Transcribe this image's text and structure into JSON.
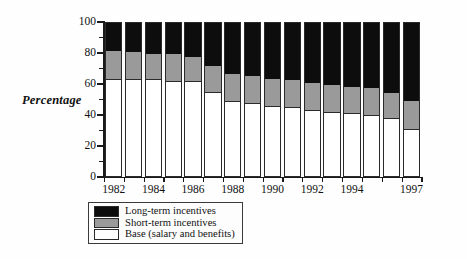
{
  "chart_data": {
    "type": "bar",
    "subtype": "stacked-100-percent",
    "title": "",
    "xlabel": "",
    "ylabel": "Percentage",
    "ylim": [
      0,
      100
    ],
    "yticks": [
      0,
      20,
      40,
      60,
      80,
      100
    ],
    "ytick_labels": [
      "0",
      "20",
      "40",
      "60",
      "80",
      "100"
    ],
    "grid": false,
    "legend_position": "below-left",
    "categories": [
      "1982",
      "1983",
      "1984",
      "1985",
      "1986",
      "1987",
      "1988",
      "1989",
      "1990",
      "1991",
      "1992",
      "1993",
      "1994",
      "1995",
      "1996",
      "1997"
    ],
    "xtick_labels": [
      "1982",
      "",
      "1984",
      "",
      "1986",
      "",
      "1988",
      "",
      "1990",
      "",
      "1992",
      "",
      "1994",
      "",
      "",
      "1997"
    ],
    "series": [
      {
        "name": "Long-term incentives",
        "color": "#0d0d0d",
        "values": [
          18,
          19,
          20,
          20,
          22,
          28,
          33,
          34,
          36,
          37,
          39,
          40,
          41,
          42,
          45,
          50
        ]
      },
      {
        "name": "Short-term incentives",
        "color": "#9a9a9a",
        "values": [
          19,
          18,
          17,
          18,
          16,
          17,
          18,
          18,
          18,
          18,
          18,
          18,
          18,
          18,
          17,
          19
        ]
      },
      {
        "name": "Base (salary and benefits)",
        "color": "#ffffff",
        "values": [
          63,
          63,
          63,
          62,
          62,
          55,
          49,
          48,
          46,
          45,
          43,
          42,
          41,
          40,
          38,
          31
        ]
      }
    ]
  },
  "legend": {
    "items": [
      {
        "label": "Long-term incentives",
        "swatch": "sw-long"
      },
      {
        "label": "Short-term incentives",
        "swatch": "sw-short"
      },
      {
        "label": "Base (salary and benefits)",
        "swatch": "sw-base"
      }
    ]
  },
  "axis": {
    "y_title": "Percentage"
  }
}
